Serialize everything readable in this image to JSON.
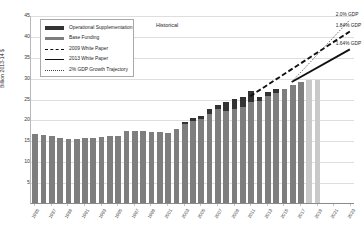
{
  "chart_data": {
    "type": "bar",
    "title": "",
    "annotation_region": "Historical",
    "xlabel": "",
    "ylabel": "Billion 2013-14 $",
    "ylim": [
      0,
      45
    ],
    "yticks": [
      5,
      10,
      15,
      20,
      25,
      30,
      35,
      40,
      45
    ],
    "grid": true,
    "legend_position": "upper-left",
    "categories": [
      "1985",
      "1986",
      "1987",
      "1988",
      "1989",
      "1990",
      "1991",
      "1992",
      "1993",
      "1994",
      "1995",
      "1996",
      "1997",
      "1998",
      "1999",
      "2000",
      "2001",
      "2002",
      "2003",
      "2004",
      "2005",
      "2006",
      "2007",
      "2008",
      "2009",
      "2010",
      "2011",
      "2012",
      "2013",
      "2014",
      "2015",
      "2016",
      "2017",
      "2018",
      "2019",
      "2020",
      "2021",
      "2022",
      "2023"
    ],
    "xtick_labels": [
      "1985",
      "1987",
      "1989",
      "1991",
      "1993",
      "1995",
      "1997",
      "1999",
      "2001",
      "2003",
      "2005",
      "2007",
      "2009",
      "2011",
      "2013",
      "2015",
      "2017",
      "2019",
      "2021",
      "2023"
    ],
    "series": [
      {
        "name": "Base Funding",
        "color": "#7e7e7e",
        "values": [
          16.6,
          16.4,
          16.0,
          15.6,
          15.4,
          15.3,
          15.6,
          15.6,
          15.8,
          16.0,
          16.1,
          17.2,
          17.3,
          17.2,
          17.1,
          17.0,
          16.8,
          17.6,
          18.9,
          19.6,
          20.1,
          21.4,
          22.4,
          22.1,
          22.5,
          23.0,
          24.2,
          24.5,
          25.5,
          26.3,
          27.3,
          28.2,
          29.0,
          0,
          0,
          0,
          0,
          0,
          0
        ],
        "projected_color": "#c9c9c9",
        "projected_values": [
          0,
          0,
          0,
          0,
          0,
          0,
          0,
          0,
          0,
          0,
          0,
          0,
          0,
          0,
          0,
          0,
          0,
          0,
          0,
          0,
          0,
          0,
          0,
          0,
          0,
          0,
          0,
          0,
          0,
          0,
          0,
          0,
          0,
          29.4,
          29.5,
          0,
          0,
          0,
          0
        ]
      },
      {
        "name": "Operational Supplementation",
        "color": "#333333",
        "values": [
          0,
          0,
          0,
          0,
          0,
          0,
          0,
          0,
          0,
          0,
          0,
          0,
          0,
          0,
          0,
          0,
          0,
          0,
          0.5,
          0.7,
          0.8,
          1.0,
          1.1,
          2.1,
          2.3,
          2.4,
          2.5,
          0.9,
          1.0,
          0.9,
          0,
          0,
          0,
          0,
          0,
          0,
          0,
          0,
          0
        ]
      }
    ],
    "lines": [
      {
        "name": "2009 White Paper",
        "style": "dashed",
        "color": "#111111",
        "end_label": "1.84% GDP",
        "points": [
          {
            "x": "2011",
            "y": 25.8
          },
          {
            "x": "2023",
            "y": 41.3
          }
        ]
      },
      {
        "name": "2013 White Paper",
        "style": "solid",
        "color": "#111111",
        "end_label": "1.64% GDP",
        "points": [
          {
            "x": "2016",
            "y": 29.2
          },
          {
            "x": "2023",
            "y": 37.0
          }
        ]
      },
      {
        "name": "2% GDP Growth Trajectory",
        "style": "dotted",
        "color": "#444444",
        "end_label": "2.0% GDP",
        "points": [
          {
            "x": "2016",
            "y": 29.2
          },
          {
            "x": "2023",
            "y": 44.1
          }
        ]
      }
    ],
    "legend_entries": [
      {
        "label": "Operational Supplementation",
        "key": "swatch-dark"
      },
      {
        "label": "Base Funding",
        "key": "swatch-gray"
      },
      {
        "label": "2009 White Paper",
        "key": "line-dashed"
      },
      {
        "label": "2013 White Paper",
        "key": "line-solid"
      },
      {
        "label": "2% GDP Growth Trajectory",
        "key": "line-dotted"
      }
    ],
    "end_labels": [
      {
        "text": "2.0% GDP"
      },
      {
        "text": "1.84% GDP"
      },
      {
        "text": "1.64% GDP"
      }
    ]
  }
}
